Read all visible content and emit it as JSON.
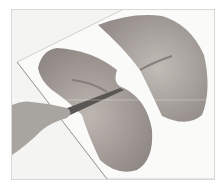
{
  "image": {
    "subject": "Two pieces of raw meat on a white cutting board, one being sliced horizontally with a knife held by a hand",
    "colors": {
      "background": "#ffffff",
      "board": "#f6f6f4",
      "meat_light": "#b9b2ad",
      "meat_dark": "#8f8884",
      "skin": "#a8a4a0",
      "knife": "#5a5654"
    }
  }
}
